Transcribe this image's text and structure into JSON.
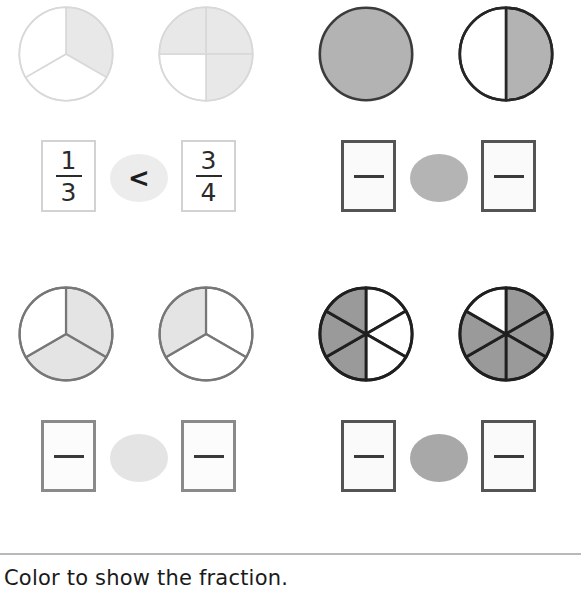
{
  "worksheet": {
    "instruction": "Color to show the fraction.",
    "palette": {
      "shade_light": "#e8e8e8",
      "shade_medium": "#b3b3b3",
      "shade_dark": "#949494",
      "outline_light": "#d2d2d2",
      "outline_medium": "#777777",
      "outline_dark": "#333333",
      "text": "#1d1d1d",
      "divider": "#b9b9b9"
    },
    "problems": [
      {
        "id": "example",
        "kind": "worked-example",
        "left_model": {
          "shape": "circle",
          "parts": 3,
          "shaded": 1,
          "shaded_sectors": [
            0
          ],
          "fill": "#e8e8e8",
          "stroke": "#d8d8d8",
          "stroke_width": 1.6,
          "start_angle": -90
        },
        "right_model": {
          "shape": "circle",
          "parts": 4,
          "shaded": 3,
          "shaded_sectors": [
            0,
            1,
            3
          ],
          "fill": "#e8e8e8",
          "stroke": "#d8d8d8",
          "stroke_width": 1.6,
          "start_angle": -90
        },
        "left_fraction": {
          "numerator": "1",
          "denominator": "3",
          "filled": true
        },
        "right_fraction": {
          "numerator": "3",
          "denominator": "4",
          "filled": true
        },
        "comparison": {
          "symbol": "<",
          "filled": true,
          "oval_tone": "tone-example"
        },
        "box_style": "example"
      },
      {
        "id": "problem-1",
        "kind": "blank",
        "left_model": {
          "shape": "circle",
          "parts": 1,
          "shaded": 1,
          "shaded_sectors": [
            0
          ],
          "fill": "#b3b3b3",
          "stroke": "#3b3b3b",
          "stroke_width": 2.6,
          "start_angle": -90
        },
        "right_model": {
          "shape": "circle",
          "parts": 2,
          "shaded": 1,
          "shaded_sectors": [
            0
          ],
          "fill": "#b3b3b3",
          "stroke": "#262626",
          "stroke_width": 2.6,
          "start_angle": -90
        },
        "left_fraction": {
          "numerator": "",
          "denominator": "",
          "filled": false
        },
        "right_fraction": {
          "numerator": "",
          "denominator": "",
          "filled": false
        },
        "comparison": {
          "symbol": "",
          "filled": false,
          "oval_tone": "tone-dark"
        },
        "box_style": "blank-dark"
      },
      {
        "id": "problem-2",
        "kind": "blank",
        "left_model": {
          "shape": "circle",
          "parts": 3,
          "shaded": 2,
          "shaded_sectors": [
            0,
            1
          ],
          "fill": "#e4e4e4",
          "stroke": "#777777",
          "stroke_width": 2.2,
          "start_angle": -90
        },
        "right_model": {
          "shape": "circle",
          "parts": 3,
          "shaded": 1,
          "shaded_sectors": [
            2
          ],
          "fill": "#e4e4e4",
          "stroke": "#777777",
          "stroke_width": 2.2,
          "start_angle": -90
        },
        "left_fraction": {
          "numerator": "",
          "denominator": "",
          "filled": false
        },
        "right_fraction": {
          "numerator": "",
          "denominator": "",
          "filled": false
        },
        "comparison": {
          "symbol": "",
          "filled": false,
          "oval_tone": "tone-light"
        },
        "box_style": "blank-gray"
      },
      {
        "id": "problem-3",
        "kind": "blank",
        "left_model": {
          "shape": "circle",
          "parts": 6,
          "shaded": 3,
          "shaded_sectors": [
            5,
            4,
            3
          ],
          "fill": "#9a9a9a",
          "stroke": "#1f1f1f",
          "stroke_width": 2.8,
          "start_angle": -90
        },
        "right_model": {
          "shape": "circle",
          "parts": 6,
          "shaded": 5,
          "shaded_sectors": [
            0,
            1,
            2,
            3,
            4
          ],
          "fill": "#9a9a9a",
          "stroke": "#1f1f1f",
          "stroke_width": 2.8,
          "start_angle": -90
        },
        "left_fraction": {
          "numerator": "",
          "denominator": "",
          "filled": false
        },
        "right_fraction": {
          "numerator": "",
          "denominator": "",
          "filled": false
        },
        "comparison": {
          "symbol": "",
          "filled": false,
          "oval_tone": "tone-mid"
        },
        "box_style": "blank-dark"
      }
    ]
  }
}
